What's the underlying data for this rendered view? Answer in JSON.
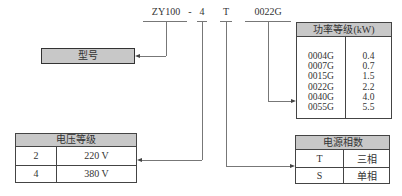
{
  "model_code": {
    "parts": [
      {
        "id": "series",
        "text": "ZY100"
      },
      {
        "id": "sep",
        "text": "-"
      },
      {
        "id": "voltage",
        "text": "4"
      },
      {
        "id": "phase",
        "text": "T"
      },
      {
        "id": "power",
        "text": "0022G"
      }
    ]
  },
  "model_box": {
    "label": "型号"
  },
  "power_table": {
    "title": "功率等级(kW)",
    "codes": [
      "0004G",
      "0007G",
      "0015G",
      "0022G",
      "0040G",
      "0055G"
    ],
    "values": [
      "0.4",
      "0.7",
      "1.5",
      "2.2",
      "4.0",
      "5.5"
    ]
  },
  "voltage_table": {
    "title": "电压等级",
    "rows": [
      {
        "code": "2",
        "value": "220 V"
      },
      {
        "code": "4",
        "value": "380 V"
      }
    ]
  },
  "phase_table": {
    "title": "电源相数",
    "rows": [
      {
        "code": "T",
        "value": "三相"
      },
      {
        "code": "S",
        "value": "单相"
      }
    ]
  },
  "colors": {
    "header_fill": "#c8c8c8",
    "line": "#777777",
    "border": "#444444"
  }
}
